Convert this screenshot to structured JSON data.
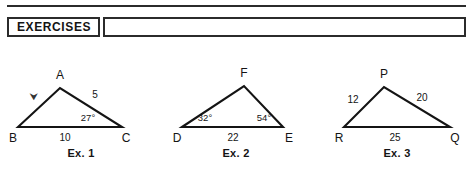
{
  "header": {
    "tag_label": "EXERCISES",
    "bar_content": ""
  },
  "figures": [
    {
      "id": "ex1",
      "caption": "Ex. 1",
      "vertices": [
        {
          "name": "A",
          "label": "A"
        },
        {
          "name": "B",
          "label": "B"
        },
        {
          "name": "C",
          "label": "C"
        }
      ],
      "side_labels": [
        {
          "name": "side-ac",
          "label": "5"
        },
        {
          "name": "side-bc",
          "label": "10"
        }
      ],
      "angle_labels": [
        {
          "name": "angle-c",
          "label": "27°"
        }
      ],
      "marks": [
        {
          "name": "side-ab-mark",
          "label": "⮟"
        }
      ]
    },
    {
      "id": "ex2",
      "caption": "Ex. 2",
      "vertices": [
        {
          "name": "F",
          "label": "F"
        },
        {
          "name": "D",
          "label": "D"
        },
        {
          "name": "E",
          "label": "E"
        }
      ],
      "side_labels": [
        {
          "name": "side-de",
          "label": "22"
        }
      ],
      "angle_labels": [
        {
          "name": "angle-d",
          "label": "32°"
        },
        {
          "name": "angle-e",
          "label": "54°"
        }
      ],
      "marks": []
    },
    {
      "id": "ex3",
      "caption": "Ex. 3",
      "vertices": [
        {
          "name": "P",
          "label": "P"
        },
        {
          "name": "R",
          "label": "R"
        },
        {
          "name": "Q",
          "label": "Q"
        }
      ],
      "side_labels": [
        {
          "name": "side-pr",
          "label": "12"
        },
        {
          "name": "side-pq",
          "label": "20"
        },
        {
          "name": "side-rq",
          "label": "25"
        }
      ],
      "angle_labels": [],
      "marks": []
    }
  ],
  "colors": {
    "ink": "#111111",
    "rule": "#2b2b2b",
    "background": "#ffffff"
  }
}
